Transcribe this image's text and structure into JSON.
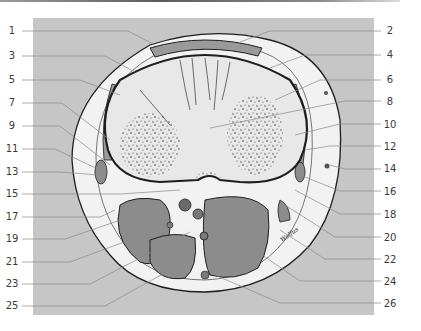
{
  "figure": {
    "type": "anatomical cross-section diagram",
    "colors": {
      "panel_bg": "#c6c6c6",
      "bone": "#e8e8e8",
      "muscle": "#8c8c8c",
      "fat": "#f2f2f2",
      "outline": "#1e1e1e",
      "leader_line": "#8a8a8a",
      "label_text": "#3a3a3a"
    },
    "signature": "Wolfus"
  },
  "labels": {
    "left": [
      {
        "num": "1",
        "y": 28
      },
      {
        "num": "3",
        "y": 53
      },
      {
        "num": "5",
        "y": 78
      },
      {
        "num": "7",
        "y": 101
      },
      {
        "num": "9",
        "y": 125
      },
      {
        "num": "11",
        "y": 147
      },
      {
        "num": "13",
        "y": 170
      },
      {
        "num": "15",
        "y": 192
      },
      {
        "num": "17",
        "y": 215
      },
      {
        "num": "19",
        "y": 238
      },
      {
        "num": "21",
        "y": 260
      },
      {
        "num": "23",
        "y": 283
      },
      {
        "num": "25",
        "y": 305
      }
    ],
    "right": [
      {
        "num": "2",
        "y": 30
      },
      {
        "num": "4",
        "y": 55
      },
      {
        "num": "6",
        "y": 79
      },
      {
        "num": "8",
        "y": 101
      },
      {
        "num": "10",
        "y": 124
      },
      {
        "num": "12",
        "y": 146
      },
      {
        "num": "14",
        "y": 168
      },
      {
        "num": "16",
        "y": 191
      },
      {
        "num": "18",
        "y": 214
      },
      {
        "num": "20",
        "y": 237
      },
      {
        "num": "22",
        "y": 259
      },
      {
        "num": "24",
        "y": 281
      },
      {
        "num": "26",
        "y": 303
      }
    ]
  }
}
